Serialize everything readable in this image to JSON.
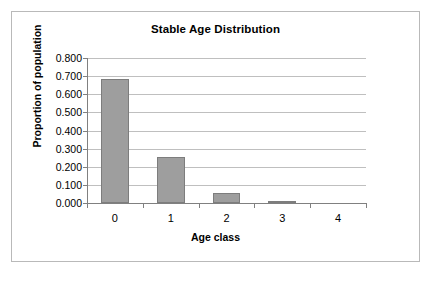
{
  "chart_data": {
    "type": "bar",
    "title": "Stable Age Distribution",
    "xlabel": "Age class",
    "ylabel": "Proportion of population",
    "categories": [
      "0",
      "1",
      "2",
      "3",
      "4"
    ],
    "values": [
      0.685,
      0.252,
      0.055,
      0.008,
      0.0
    ],
    "ylim": [
      0.0,
      0.8
    ],
    "ytick_labels": [
      "0.800",
      "0.700",
      "0.600",
      "0.500",
      "0.400",
      "0.300",
      "0.200",
      "0.100",
      "0.000"
    ],
    "ytick_values": [
      0.8,
      0.7,
      0.6,
      0.5,
      0.4,
      0.3,
      0.2,
      0.1,
      0.0
    ],
    "grid": "horizontal",
    "legend": "none",
    "series": [
      {
        "name": "Proportion of population",
        "values": [
          0.685,
          0.252,
          0.055,
          0.008,
          0.0
        ]
      }
    ],
    "colors": {
      "bar_fill": "#9e9e9e",
      "bar_border": "#7d7d7d",
      "gridline": "#bfbfbf",
      "axis": "#808080",
      "frame": "#b9b9b9",
      "background": "#ffffff",
      "text": "#000000"
    }
  }
}
